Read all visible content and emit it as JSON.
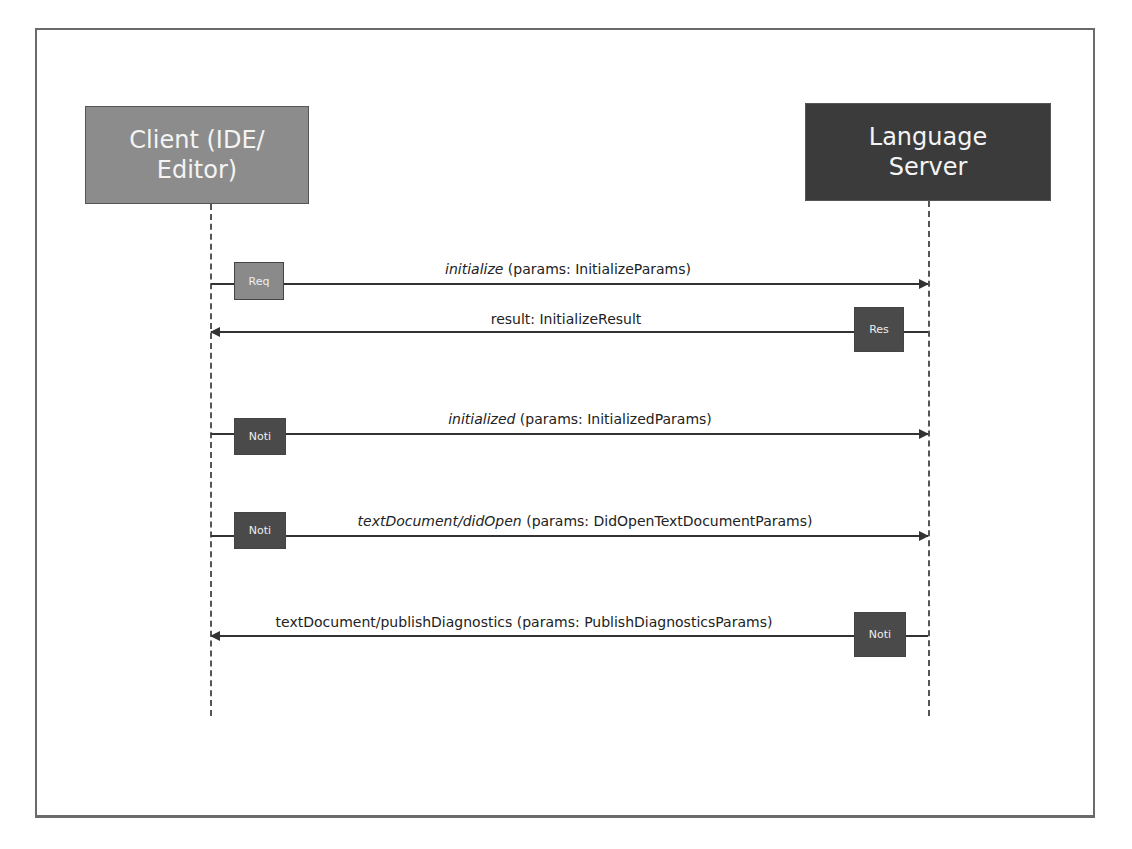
{
  "diagram": {
    "type": "sequence",
    "actors": {
      "client": {
        "label": "Client (IDE/ Editor)",
        "line1": "Client (IDE/",
        "line2": "Editor)",
        "color": "#8c8c8c"
      },
      "server": {
        "label": "Language Server",
        "line1": "Language",
        "line2": "Server",
        "color": "#3b3b3b"
      }
    },
    "messages": [
      {
        "direction": "client_to_server",
        "kind_tag": "Req",
        "method": "initialize",
        "params": " (params: InitializeParams)",
        "tag_side": "client"
      },
      {
        "direction": "server_to_client",
        "kind_tag": "Res",
        "method": "",
        "params": "result: InitializeResult",
        "tag_side": "server"
      },
      {
        "direction": "client_to_server",
        "kind_tag": "Noti",
        "method": "initialized",
        "params": " (params: InitializedParams)",
        "tag_side": "client"
      },
      {
        "direction": "client_to_server",
        "kind_tag": "Noti",
        "method": "textDocument/didOpen",
        "params": " (params: DidOpenTextDocumentParams)",
        "tag_side": "client"
      },
      {
        "direction": "server_to_client",
        "kind_tag": "Noti",
        "method": "",
        "params": "textDocument/publishDiagnostics (params: PublishDiagnosticsParams)",
        "tag_side": "server"
      }
    ],
    "colors": {
      "request_tag": "#8a8a8a",
      "dark_tag": "#4a4a4a",
      "line": "#333333"
    }
  }
}
